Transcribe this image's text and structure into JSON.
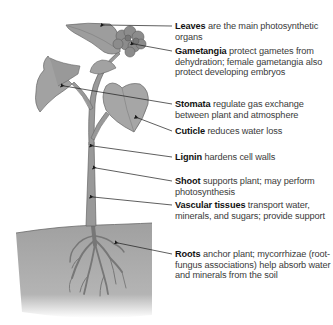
{
  "diagram": {
    "colors": {
      "plant_fill": "#9a9a9a",
      "plant_stroke": "#6a6a6a",
      "soil": "#a8a8a8",
      "leader_line": "#1a1a1a",
      "term_text": "#111111",
      "description_text": "#3a3a3a"
    },
    "labels": [
      {
        "term": "Leaves",
        "description": " are the main photosynthetic organs"
      },
      {
        "term": "Gametangia",
        "description": " protect gametes from dehydration; female gametangia also protect developing embryos"
      },
      {
        "term": "Stomata",
        "description": " regulate gas exchange between plant and atmosphere"
      },
      {
        "term": "Cuticle",
        "description": " reduces water loss"
      },
      {
        "term": "Lignin",
        "description": " hardens cell walls"
      },
      {
        "term": "Shoot",
        "description": " supports plant; may perform photosynthesis"
      },
      {
        "term": "Vascular tissues",
        "description": " transport water, minerals, and sugars; provide support"
      },
      {
        "term": "Roots",
        "description": " anchor plant; mycorrhizae (root-fungus associations) help absorb water and minerals from the soil"
      }
    ]
  }
}
